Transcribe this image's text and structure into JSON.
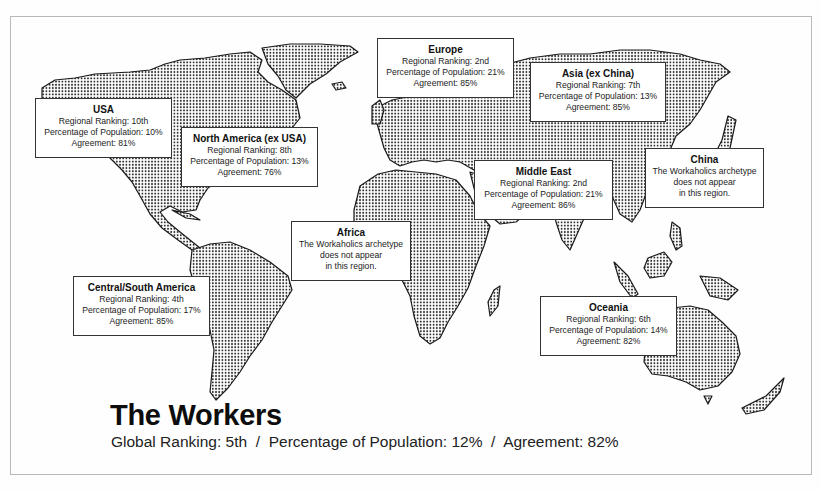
{
  "title": "The Workers",
  "summary": {
    "global_ranking": "Global Ranking: 5th",
    "percentage": "Percentage of Population: 12%",
    "agreement": "Agreement: 82%",
    "separator": "/"
  },
  "regions": {
    "usa": {
      "name": "USA",
      "line1": "Regional Ranking: 10th",
      "line2": "Percentage of Population: 10%",
      "line3": "Agreement: 81%"
    },
    "north_america": {
      "name": "North America (ex USA)",
      "line1": "Regional Ranking: 8th",
      "line2": "Percentage of Population: 13%",
      "line3": "Agreement: 76%"
    },
    "europe": {
      "name": "Europe",
      "line1": "Regional Ranking: 2nd",
      "line2": "Percentage of Population: 21%",
      "line3": "Agreement: 85%"
    },
    "asia": {
      "name": "Asia (ex China)",
      "line1": "Regional Ranking: 7th",
      "line2": "Percentage of Population: 13%",
      "line3": "Agreement: 85%"
    },
    "middle_east": {
      "name": "Middle East",
      "line1": "Regional Ranking: 2nd",
      "line2": "Percentage of Population: 21%",
      "line3": "Agreement: 86%"
    },
    "china": {
      "name": "China",
      "line1": "The Workaholics archetype",
      "line2": "does not appear",
      "line3": "in this region."
    },
    "africa": {
      "name": "Africa",
      "line1": "The Workaholics archetype",
      "line2": "does not appear",
      "line3": "in this region."
    },
    "central_south_america": {
      "name": "Central/South America",
      "line1": "Regional Ranking: 4th",
      "line2": "Percentage of Population: 17%",
      "line3": "Agreement: 85%"
    },
    "oceania": {
      "name": "Oceania",
      "line1": "Regional Ranking: 6th",
      "line2": "Percentage of Population: 14%",
      "line3": "Agreement: 82%"
    }
  },
  "colors": {
    "land_outline": "#1a1a1a",
    "dot": "#2a2a2a",
    "box_border": "#333333",
    "frame": "#b9b9b9"
  }
}
